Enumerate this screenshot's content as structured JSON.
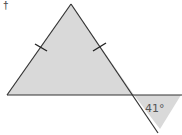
{
  "diagram": {
    "type": "isosceles-triangle-with-exterior-angle",
    "corner_mark": "†",
    "angle_label": "41°",
    "colors": {
      "fill": "#d9d9d9",
      "stroke": "#333333",
      "text": "#555555"
    },
    "points": {
      "apex": [
        71,
        4
      ],
      "base_left": [
        7,
        95
      ],
      "base_right": [
        134,
        95
      ],
      "line_end_right": [
        182,
        95
      ],
      "diagonal_end": [
        158,
        133
      ],
      "shade_tip": [
        160,
        129
      ]
    },
    "tick_marks": [
      "left-side",
      "right-side"
    ]
  }
}
